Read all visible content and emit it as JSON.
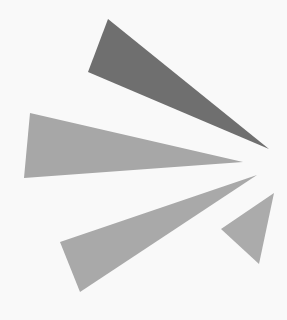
{
  "figure": {
    "background_color": "#f9f9f9",
    "shapes": [
      {
        "name": "dark-triangle-top",
        "points": "108,19 88,72 269,149",
        "fill": "#6f6f6f"
      },
      {
        "name": "light-triangle-left",
        "points": "30,113 24,178 243,162",
        "fill": "#a7a7a7"
      },
      {
        "name": "light-triangle-lower",
        "points": "60,242 80,292 257,175",
        "fill": "#a9a9a9"
      },
      {
        "name": "light-triangle-small-right",
        "points": "221,229 274,193 259,264",
        "fill": "#ababab"
      }
    ]
  }
}
